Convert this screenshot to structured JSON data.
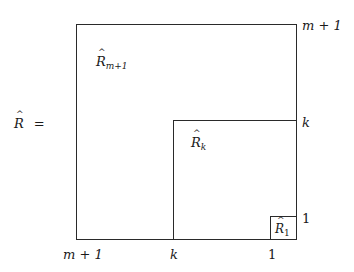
{
  "diagram": {
    "lhs": {
      "symbol": "R",
      "accent": "hat",
      "operator": "="
    },
    "blocks": [
      {
        "id": "outer",
        "symbol": "R",
        "subscript": "m+1",
        "label": "R̂_{m+1}"
      },
      {
        "id": "middle",
        "symbol": "R",
        "subscript": "k",
        "label": "R̂_k"
      },
      {
        "id": "inner",
        "symbol": "R",
        "subscript": "1",
        "label": "R̂_1"
      }
    ],
    "right_axis_labels": [
      "m + 1",
      "k",
      "1"
    ],
    "bottom_axis_labels": [
      "m + 1",
      "k",
      "1"
    ]
  }
}
